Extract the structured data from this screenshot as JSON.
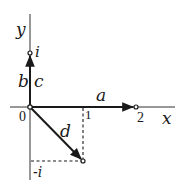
{
  "diagram": {
    "type": "complex-plane-vectors",
    "axes": {
      "x_label": "x",
      "y_label": "y",
      "origin_label": "0"
    },
    "ticks": {
      "x_one": "1",
      "x_two": "2",
      "y_i": "i",
      "y_minus_i": "-i"
    },
    "vectors": [
      {
        "name": "a",
        "label": "a",
        "from": [
          0,
          0
        ],
        "to": [
          2,
          0
        ]
      },
      {
        "name": "b",
        "label": "b",
        "from": [
          0,
          0
        ],
        "to": [
          0,
          1
        ]
      },
      {
        "name": "c",
        "label": "c",
        "from": [
          0,
          0
        ],
        "to": [
          0,
          1
        ]
      },
      {
        "name": "d",
        "label": "d",
        "from": [
          0,
          0
        ],
        "to": [
          1,
          -1
        ]
      }
    ],
    "points": [
      {
        "name": "i",
        "coords": [
          0,
          1
        ]
      },
      {
        "name": "2",
        "coords": [
          2,
          0
        ]
      },
      {
        "name": "1-i",
        "coords": [
          1,
          -1
        ]
      }
    ],
    "colors": {
      "ink": "#1a1a1a",
      "background": "#ffffff"
    }
  }
}
